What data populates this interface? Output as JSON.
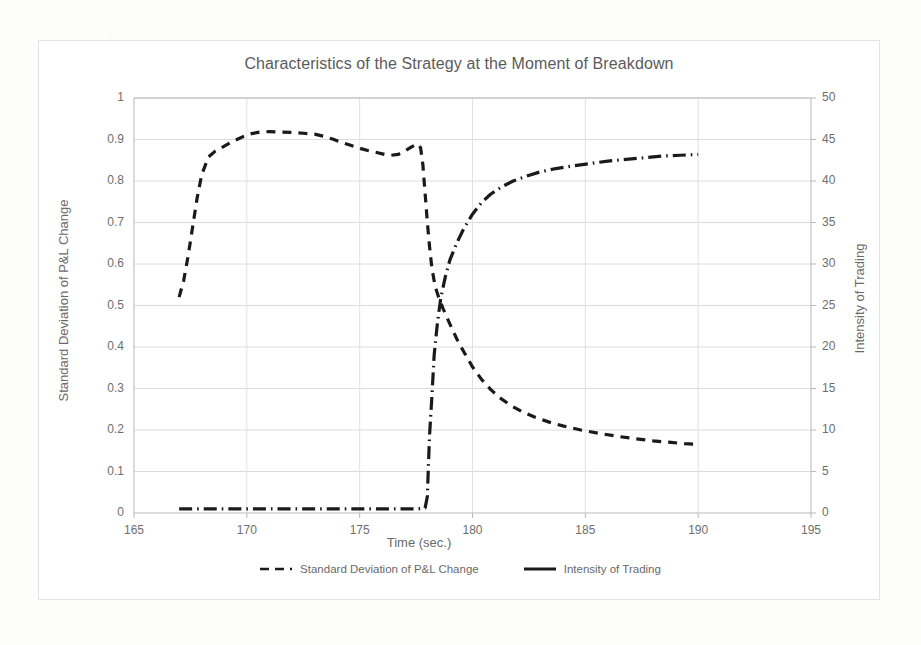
{
  "chart_data": {
    "type": "line",
    "title": "Characteristics of the Strategy at the Moment of Breakdown",
    "xlabel": "Time (sec.)",
    "ylabel": "Standard Deviation of P&L Change",
    "y2label": "Intensity of Trading",
    "xlim": [
      165,
      195
    ],
    "ylim": [
      0,
      1
    ],
    "y2lim": [
      0,
      50
    ],
    "xticks": [
      165,
      170,
      175,
      180,
      185,
      190,
      195
    ],
    "yticks": [
      0,
      0.1,
      0.2,
      0.3,
      0.4,
      0.5,
      0.6,
      0.7,
      0.8,
      0.9,
      1
    ],
    "y2ticks": [
      0,
      5,
      10,
      15,
      20,
      25,
      30,
      35,
      40,
      45,
      50
    ],
    "grid": true,
    "legend_position": "bottom",
    "series": [
      {
        "name": "Standard Deviation of P&L Change",
        "axis": "left",
        "style": "dashed",
        "color": "#1a1a1a",
        "points": [
          [
            167.0,
            0.52
          ],
          [
            167.2,
            0.56
          ],
          [
            167.4,
            0.62
          ],
          [
            167.6,
            0.69
          ],
          [
            167.8,
            0.76
          ],
          [
            168.0,
            0.815
          ],
          [
            168.3,
            0.858
          ],
          [
            168.6,
            0.872
          ],
          [
            169.0,
            0.884
          ],
          [
            169.4,
            0.896
          ],
          [
            169.8,
            0.906
          ],
          [
            170.2,
            0.914
          ],
          [
            170.6,
            0.918
          ],
          [
            171.0,
            0.919
          ],
          [
            171.5,
            0.918
          ],
          [
            172.0,
            0.917
          ],
          [
            172.5,
            0.915
          ],
          [
            173.0,
            0.913
          ],
          [
            173.4,
            0.908
          ],
          [
            173.8,
            0.901
          ],
          [
            174.2,
            0.893
          ],
          [
            174.6,
            0.886
          ],
          [
            175.0,
            0.879
          ],
          [
            175.4,
            0.873
          ],
          [
            175.8,
            0.868
          ],
          [
            176.1,
            0.864
          ],
          [
            176.4,
            0.862
          ],
          [
            176.7,
            0.864
          ],
          [
            177.0,
            0.872
          ],
          [
            177.3,
            0.882
          ],
          [
            177.5,
            0.888
          ],
          [
            177.6,
            0.889
          ],
          [
            177.7,
            0.88
          ],
          [
            177.8,
            0.84
          ],
          [
            177.9,
            0.77
          ],
          [
            178.0,
            0.7
          ],
          [
            178.1,
            0.64
          ],
          [
            178.2,
            0.59
          ],
          [
            178.35,
            0.545
          ],
          [
            178.5,
            0.52
          ],
          [
            178.7,
            0.492
          ],
          [
            179.0,
            0.455
          ],
          [
            179.3,
            0.42
          ],
          [
            179.6,
            0.39
          ],
          [
            180.0,
            0.352
          ],
          [
            180.4,
            0.322
          ],
          [
            180.8,
            0.298
          ],
          [
            181.2,
            0.278
          ],
          [
            181.7,
            0.259
          ],
          [
            182.2,
            0.244
          ],
          [
            182.8,
            0.23
          ],
          [
            183.4,
            0.219
          ],
          [
            184.0,
            0.21
          ],
          [
            184.8,
            0.2
          ],
          [
            185.6,
            0.192
          ],
          [
            186.4,
            0.185
          ],
          [
            187.2,
            0.179
          ],
          [
            188.0,
            0.174
          ],
          [
            188.8,
            0.17
          ],
          [
            189.4,
            0.167
          ],
          [
            190.0,
            0.165
          ]
        ]
      },
      {
        "name": "Intensity of Trading",
        "axis": "right",
        "style": "dash-dot",
        "color": "#1a1a1a",
        "points": [
          [
            167.0,
            0.5
          ],
          [
            168.0,
            0.5
          ],
          [
            169.0,
            0.5
          ],
          [
            170.0,
            0.5
          ],
          [
            171.0,
            0.5
          ],
          [
            172.0,
            0.5
          ],
          [
            173.0,
            0.5
          ],
          [
            174.0,
            0.5
          ],
          [
            175.0,
            0.5
          ],
          [
            176.0,
            0.5
          ],
          [
            177.0,
            0.5
          ],
          [
            177.6,
            0.5
          ],
          [
            177.9,
            0.6
          ],
          [
            178.0,
            2.0
          ],
          [
            178.05,
            6.0
          ],
          [
            178.1,
            9.5
          ],
          [
            178.2,
            14.0
          ],
          [
            178.3,
            19.0
          ],
          [
            178.45,
            23.0
          ],
          [
            178.6,
            26.0
          ],
          [
            178.8,
            28.5
          ],
          [
            179.0,
            30.5
          ],
          [
            179.3,
            32.5
          ],
          [
            179.6,
            34.2
          ],
          [
            180.0,
            36.0
          ],
          [
            180.4,
            37.4
          ],
          [
            180.8,
            38.4
          ],
          [
            181.3,
            39.3
          ],
          [
            181.8,
            40.0
          ],
          [
            182.4,
            40.6
          ],
          [
            183.0,
            41.1
          ],
          [
            183.7,
            41.5
          ],
          [
            184.4,
            41.8
          ],
          [
            185.2,
            42.1
          ],
          [
            186.0,
            42.4
          ],
          [
            186.8,
            42.6
          ],
          [
            187.6,
            42.8
          ],
          [
            188.4,
            43.0
          ],
          [
            189.2,
            43.1
          ],
          [
            190.0,
            43.2
          ]
        ]
      }
    ]
  },
  "legend": {
    "items": [
      {
        "label": "Standard Deviation of P&L Change",
        "style": "dashed"
      },
      {
        "label": "Intensity of Trading",
        "style": "dash-dot"
      }
    ]
  }
}
